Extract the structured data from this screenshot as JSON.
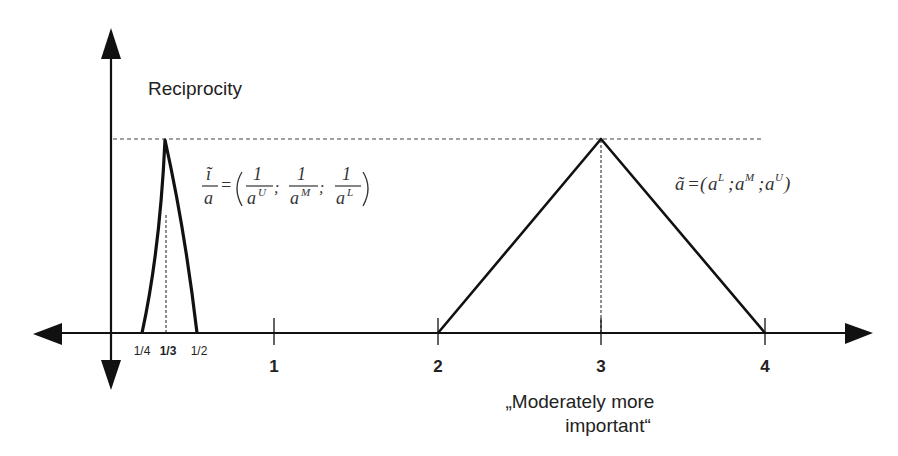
{
  "diagram": {
    "y_axis_label": "Reciprocity",
    "x_ticks": [
      {
        "label": "1/4",
        "x": 142,
        "bold": false
      },
      {
        "label": "1/3",
        "x": 166,
        "bold": true
      },
      {
        "label": "1/2",
        "x": 197,
        "bold": false
      },
      {
        "label": "1",
        "x": 274,
        "bold": true
      },
      {
        "label": "2",
        "x": 438,
        "bold": true
      },
      {
        "label": "3",
        "x": 601,
        "bold": true
      },
      {
        "label": "4",
        "x": 765,
        "bold": true
      }
    ],
    "x_annotation_line1": "„Moderately more",
    "x_annotation_line2": "important“",
    "reciprocal_formula": {
      "lhs_num": "ĩ",
      "lhs_den": "a",
      "eq": "=",
      "terms": [
        {
          "num": "1",
          "den": "a",
          "sup": "U"
        },
        {
          "num": "1",
          "den": "a",
          "sup": "M"
        },
        {
          "num": "1",
          "den": "a",
          "sup": "L"
        }
      ]
    },
    "tfn_formula": {
      "lhs": "ã",
      "eq": "=",
      "open": "(",
      "terms": [
        {
          "base": "a",
          "sup": "L"
        },
        {
          "base": "a",
          "sup": "M"
        },
        {
          "base": "a",
          "sup": "U"
        }
      ],
      "sep": ";",
      "close": ")"
    },
    "triangles": [
      {
        "name": "reciprocal",
        "lower": "1/4",
        "middle": "1/3",
        "upper": "1/2"
      },
      {
        "name": "moderately-more-important",
        "lower": 2,
        "middle": 3,
        "upper": 4
      }
    ]
  }
}
